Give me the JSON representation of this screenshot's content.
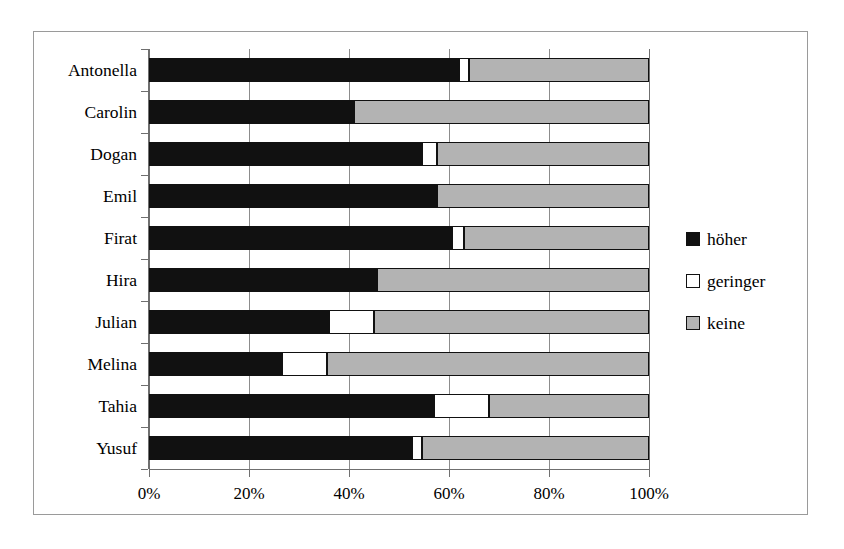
{
  "chart_data": {
    "type": "bar",
    "orientation": "horizontal",
    "stacked": true,
    "stack_mode": "percent",
    "title": "",
    "subtitle": "",
    "xlabel": "",
    "ylabel": "",
    "xlim": [
      0,
      100
    ],
    "grid": true,
    "legend_position": "right",
    "categories": [
      "Antonella",
      "Carolin",
      "Dogan",
      "Emil",
      "Firat",
      "Hira",
      "Julian",
      "Melina",
      "Tahia",
      "Yusuf"
    ],
    "x_tick_labels": [
      "0%",
      "20%",
      "40%",
      "60%",
      "80%",
      "100%"
    ],
    "x_tick_values": [
      0,
      20,
      40,
      60,
      80,
      100
    ],
    "series": [
      {
        "name": "höher",
        "color": "#111111",
        "values": [
          62,
          41,
          54.5,
          57.5,
          60.5,
          45.5,
          36,
          26.5,
          57,
          52.5
        ]
      },
      {
        "name": "geringer",
        "color": "#ffffff",
        "values": [
          2,
          0,
          3,
          0,
          2.5,
          0,
          9,
          9,
          11,
          2
        ]
      },
      {
        "name": "keine",
        "color": "#b3b3b3",
        "values": [
          36,
          59,
          42.5,
          42.5,
          37,
          54.5,
          55,
          64.5,
          32,
          45.5
        ]
      }
    ],
    "legend": [
      {
        "label": "höher",
        "color": "#111111"
      },
      {
        "label": "geringer",
        "color": "#ffffff"
      },
      {
        "label": "keine",
        "color": "#b3b3b3"
      }
    ]
  }
}
